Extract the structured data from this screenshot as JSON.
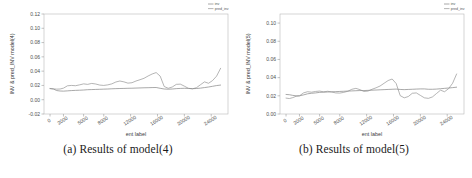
{
  "figure": {
    "panels": [
      {
        "id": "a",
        "caption": "(a) Results of model(4)",
        "chart_data": {
          "type": "line",
          "title": "",
          "xlabel": "ent label",
          "ylabel": "INV & pred_INV model(4)",
          "xlim": [
            -900,
            26500
          ],
          "ylim": [
            -0.02,
            0.12
          ],
          "xticks": [
            0,
            2000,
            5000,
            8000,
            12000,
            16000,
            20000,
            24000
          ],
          "xticklabels": [
            "0",
            "2000",
            "5000",
            "8000",
            "12000",
            "16000",
            "20000",
            "24000"
          ],
          "yticks": [
            -0.02,
            0.0,
            0.02,
            0.04,
            0.06,
            0.08,
            0.1,
            0.12
          ],
          "yticklabels": [
            "-0.02",
            "0.00",
            "0.02",
            "0.04",
            "0.06",
            "0.08",
            "0.10",
            "0.12"
          ],
          "grid": false,
          "legend_position": "outside-top-right",
          "series": [
            {
              "name": "inv",
              "color": "#7a7a7a",
              "x": [
                0,
                500,
                1000,
                1500,
                2000,
                2600,
                3200,
                3800,
                4400,
                5000,
                5600,
                6200,
                6800,
                7400,
                8000,
                8600,
                9200,
                9800,
                10400,
                11000,
                11600,
                12200,
                12800,
                13400,
                14000,
                14600,
                15200,
                15800,
                16400,
                17000,
                17600,
                18200,
                18800,
                19400,
                20000,
                20600,
                21200,
                21800,
                22400,
                23000,
                23600,
                24200,
                24800,
                25400
              ],
              "y": [
                0.0155,
                0.015,
                0.0128,
                0.0122,
                0.012,
                0.0124,
                0.0128,
                0.0131,
                0.0133,
                0.0136,
                0.014,
                0.0142,
                0.0144,
                0.0146,
                0.0148,
                0.015,
                0.0153,
                0.0155,
                0.0157,
                0.0158,
                0.016,
                0.0161,
                0.0163,
                0.0165,
                0.0167,
                0.0168,
                0.017,
                0.0171,
                0.016,
                0.015,
                0.0147,
                0.015,
                0.0155,
                0.0158,
                0.016,
                0.0158,
                0.0155,
                0.0157,
                0.0162,
                0.017,
                0.0178,
                0.0188,
                0.0198,
                0.0205
              ]
            },
            {
              "name": "pred_inv",
              "color": "#8c8c8c",
              "x": [
                0,
                500,
                1000,
                1500,
                2000,
                2600,
                3200,
                3800,
                4400,
                5000,
                5600,
                6200,
                6800,
                7400,
                8000,
                8600,
                9200,
                9800,
                10400,
                11000,
                11600,
                12200,
                12800,
                13400,
                14000,
                14600,
                15200,
                15800,
                16400,
                17000,
                17600,
                18200,
                18800,
                19400,
                20000,
                20600,
                21200,
                21800,
                22400,
                23000,
                23600,
                24200,
                24800,
                25400
              ],
              "y": [
                0.0158,
                0.0152,
                0.0148,
                0.015,
                0.0162,
                0.0195,
                0.02,
                0.0196,
                0.0208,
                0.0222,
                0.0215,
                0.0228,
                0.022,
                0.0205,
                0.02,
                0.0208,
                0.0222,
                0.0248,
                0.0262,
                0.025,
                0.0232,
                0.0238,
                0.0262,
                0.028,
                0.03,
                0.0332,
                0.036,
                0.038,
                0.033,
                0.0185,
                0.016,
                0.0178,
                0.0215,
                0.0218,
                0.019,
                0.016,
                0.0152,
                0.0168,
                0.021,
                0.025,
                0.023,
                0.0268,
                0.033,
                0.044
              ]
            }
          ]
        }
      },
      {
        "id": "b",
        "caption": "(b) Results of model(5)",
        "chart_data": {
          "type": "line",
          "title": "",
          "xlabel": "ent label",
          "ylabel": "INV & pred_INV model(5)",
          "xlim": [
            -900,
            26500
          ],
          "ylim": [
            0.0,
            0.11
          ],
          "xticks": [
            0,
            2000,
            5000,
            8000,
            12000,
            16000,
            20000,
            24000
          ],
          "xticklabels": [
            "0",
            "2000",
            "5000",
            "8000",
            "12000",
            "16000",
            "20000",
            "24000"
          ],
          "yticks": [
            0.0,
            0.02,
            0.04,
            0.06,
            0.08,
            0.1
          ],
          "yticklabels": [
            "0.00",
            "0.02",
            "0.04",
            "0.06",
            "0.08",
            "0.10"
          ],
          "grid": false,
          "legend_position": "outside-top-right",
          "series": [
            {
              "name": "inv",
              "color": "#7a7a7a",
              "x": [
                0,
                500,
                1000,
                1500,
                2000,
                2600,
                3200,
                3800,
                4400,
                5000,
                5600,
                6200,
                6800,
                7400,
                8000,
                8600,
                9200,
                9800,
                10400,
                11000,
                11600,
                12200,
                12800,
                13400,
                14000,
                14600,
                15200,
                15800,
                16400,
                17000,
                17600,
                18200,
                18800,
                19400,
                20000,
                20600,
                21200,
                21800,
                22400,
                23000,
                23600,
                24200,
                24800,
                25400
              ],
              "y": [
                0.0215,
                0.0212,
                0.0205,
                0.02,
                0.02,
                0.021,
                0.0222,
                0.0228,
                0.0232,
                0.0238,
                0.024,
                0.0242,
                0.0244,
                0.0246,
                0.0248,
                0.025,
                0.0252,
                0.0254,
                0.0256,
                0.0258,
                0.0258,
                0.026,
                0.0262,
                0.0264,
                0.0266,
                0.0268,
                0.027,
                0.0272,
                0.0274,
                0.027,
                0.0268,
                0.027,
                0.0272,
                0.0274,
                0.0276,
                0.0276,
                0.0272,
                0.0272,
                0.0274,
                0.0278,
                0.0282,
                0.0286,
                0.029,
                0.0295
              ]
            },
            {
              "name": "pred_inv",
              "color": "#8c8c8c",
              "x": [
                0,
                500,
                1000,
                1500,
                2000,
                2600,
                3200,
                3800,
                4400,
                5000,
                5600,
                6200,
                6800,
                7400,
                8000,
                8600,
                9200,
                9800,
                10400,
                11000,
                11600,
                12200,
                12800,
                13400,
                14000,
                14600,
                15200,
                15800,
                16400,
                17000,
                17600,
                18200,
                18800,
                19400,
                20000,
                20600,
                21200,
                21800,
                22400,
                23000,
                23600,
                24200,
                24800,
                25400
              ],
              "y": [
                0.0175,
                0.017,
                0.018,
                0.0195,
                0.02,
                0.0232,
                0.0245,
                0.024,
                0.0248,
                0.0252,
                0.0244,
                0.025,
                0.0242,
                0.0232,
                0.023,
                0.0238,
                0.025,
                0.0272,
                0.0282,
                0.0268,
                0.0248,
                0.0252,
                0.0272,
                0.0288,
                0.0308,
                0.0338,
                0.0368,
                0.0385,
                0.0335,
                0.0202,
                0.0178,
                0.0192,
                0.0228,
                0.0232,
                0.0205,
                0.0178,
                0.0172,
                0.0188,
                0.0225,
                0.0262,
                0.0245,
                0.0278,
                0.0338,
                0.044
              ]
            }
          ]
        }
      }
    ]
  }
}
